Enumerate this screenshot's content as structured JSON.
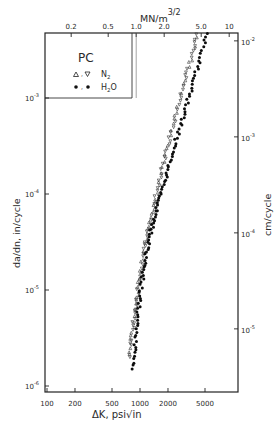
{
  "chart_data": {
    "type": "scatter",
    "title": "",
    "xlabel": "ΔK, psi√in",
    "ylabel": "da/dn, in/cycle",
    "x2label": "MN/m",
    "x2label_exp": "3/2",
    "y2label": "cm/cycle",
    "xscale": "log",
    "yscale": "log",
    "xlim": [
      100,
      7500
    ],
    "ylim": [
      1e-06,
      0.014
    ],
    "grid": false,
    "legend": {
      "title": "PC",
      "position": "upper-left",
      "entries": [
        {
          "marker": "open-triangle",
          "label": "N",
          "sub": "2"
        },
        {
          "marker": "filled-circle",
          "label": "H",
          "sub": "2",
          "suffix": "O"
        }
      ]
    },
    "x_ticks": [
      {
        "value": 100,
        "label": "100"
      },
      {
        "value": 200,
        "label": "200"
      },
      {
        "value": 500,
        "label": "500"
      },
      {
        "value": 1000,
        "label": "1000"
      },
      {
        "value": 2000,
        "label": "2000"
      },
      {
        "value": 5000,
        "label": "5000"
      }
    ],
    "x2_ticks": [
      {
        "value": 0.2,
        "label": "0.2"
      },
      {
        "value": 0.5,
        "label": "0.5"
      },
      {
        "value": 1.0,
        "label": "1.0"
      },
      {
        "value": 2.0,
        "label": "2.0"
      },
      {
        "value": 5.0,
        "label": "5.0"
      },
      {
        "value": 10,
        "label": "10"
      }
    ],
    "y_ticks": [
      {
        "value": 0.001,
        "base": "10",
        "exp": "-3"
      },
      {
        "value": 0.0001,
        "base": "10",
        "exp": "-4"
      },
      {
        "value": 1e-05,
        "base": "10",
        "exp": "-5"
      },
      {
        "value": 1e-06,
        "base": "10",
        "exp": "-6"
      }
    ],
    "y2_ticks": [
      {
        "value": 0.01,
        "base": "10",
        "exp": "-2"
      },
      {
        "value": 0.001,
        "base": "10",
        "exp": "-3"
      },
      {
        "value": 0.0001,
        "base": "10",
        "exp": "-4"
      },
      {
        "value": 1e-05,
        "base": "10",
        "exp": "-5"
      }
    ],
    "series": [
      {
        "name": "N2",
        "marker": "open-triangle",
        "x": [
          780,
          800,
          830,
          860,
          900,
          940,
          980,
          1020,
          1080,
          1150,
          1220,
          1300,
          1400,
          1500,
          1620,
          1750,
          1900,
          2050,
          2250,
          2450,
          2700,
          3000,
          3300,
          3650,
          4000,
          4400,
          4800,
          5100
        ],
        "y": [
          2e-06,
          2.8e-06,
          3.8e-06,
          5e-06,
          6.8e-06,
          9e-06,
          1.2e-05,
          1.6e-05,
          2.2e-05,
          3e-05,
          4e-05,
          5.5e-05,
          7.5e-05,
          0.0001,
          0.00014,
          0.00019,
          0.00026,
          0.00036,
          0.0005,
          0.0007,
          0.001,
          0.0014,
          0.002,
          0.0029,
          0.004,
          0.0056,
          0.0078,
          0.0105
        ]
      },
      {
        "name": "H2O",
        "marker": "filled-circle",
        "x": [
          850,
          880,
          900,
          930,
          960,
          1000,
          1050,
          1100,
          1160,
          1230,
          1300,
          1380,
          1480,
          1600,
          1750,
          1900,
          2050,
          2250,
          2500,
          2800,
          3100,
          3450,
          3850,
          4300,
          4800,
          5300,
          5800
        ],
        "y": [
          1.5e-06,
          2.2e-06,
          3.2e-06,
          4.5e-06,
          6.3e-06,
          8.8e-06,
          1.2e-05,
          1.6e-05,
          2.2e-05,
          3e-05,
          4e-05,
          5e-05,
          6.5e-05,
          8.5e-05,
          0.00011,
          0.00015,
          0.0002,
          0.00028,
          0.00039,
          0.00055,
          0.00078,
          0.0011,
          0.0016,
          0.0023,
          0.0034,
          0.0052,
          0.0085
        ]
      }
    ]
  }
}
